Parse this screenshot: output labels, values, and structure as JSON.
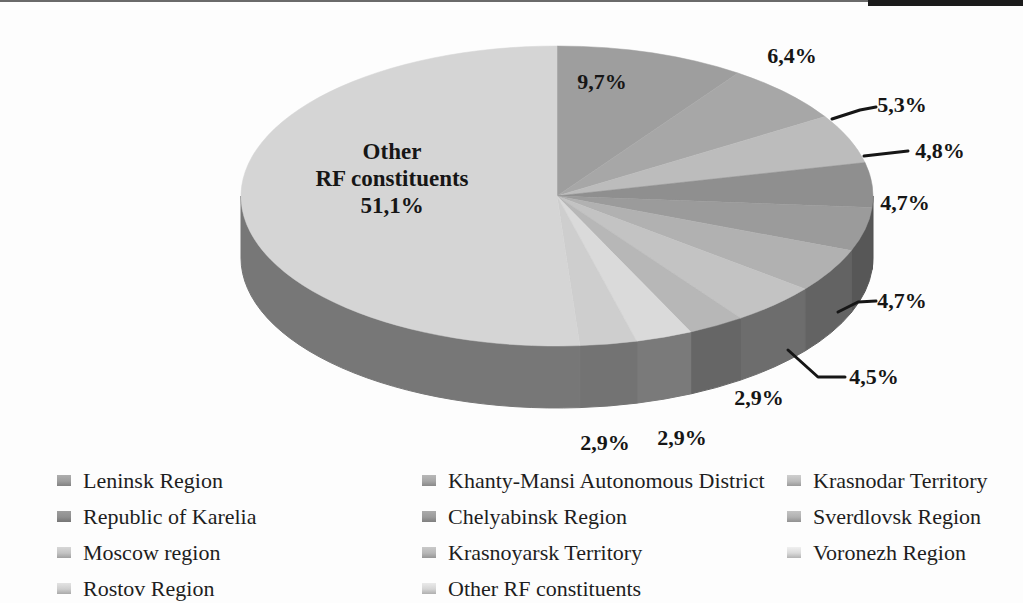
{
  "page": {
    "background": "#fdfdfd",
    "top_rule_color": "#1b1b1b"
  },
  "chart_data": {
    "type": "pie",
    "style": "3d",
    "title": "",
    "decimal_separator": ",",
    "start_angle_deg": 0,
    "direction": "clockwise",
    "legend_position": "bottom",
    "slices": [
      {
        "label": "Leninsk Region",
        "value": 9.7,
        "display": "9,7%",
        "color": "#9e9e9e"
      },
      {
        "label": "Khanty-Mansi Autonomous District",
        "value": 6.4,
        "display": "6,4%",
        "color": "#a7a7a7"
      },
      {
        "label": "Krasnodar Territory",
        "value": 5.3,
        "display": "5,3%",
        "color": "#bcbcbc"
      },
      {
        "label": "Republic of Karelia",
        "value": 4.8,
        "display": "4,8%",
        "color": "#8f8f8f"
      },
      {
        "label": "Chelyabinsk Region",
        "value": 4.7,
        "display": "4,7%",
        "color": "#9b9b9b"
      },
      {
        "label": "Sverdlovsk Region",
        "value": 4.7,
        "display": "4,7%",
        "color": "#b1b1b1"
      },
      {
        "label": "Moscow region",
        "value": 4.5,
        "display": "4,5%",
        "color": "#c3c3c3"
      },
      {
        "label": "Krasnoyarsk Territory",
        "value": 2.9,
        "display": "2,9%",
        "color": "#b7b7b7"
      },
      {
        "label": "Voronezh Region",
        "value": 2.9,
        "display": "2,9%",
        "color": "#dadada"
      },
      {
        "label": "Rostov Region",
        "value": 2.9,
        "display": "2,9%",
        "color": "#cecece"
      },
      {
        "label": "Other RF constituents",
        "value": 51.1,
        "display": "51,1%",
        "color": "#d5d5d5",
        "inner_label_lines": [
          "Other",
          "RF constituents",
          "51,1%"
        ]
      }
    ],
    "legend_columns": [
      [
        "Leninsk Region",
        "Republic of Karelia",
        "Moscow region",
        "Rostov Region"
      ],
      [
        "Khanty-Mansi Autonomous District",
        "Chelyabinsk Region",
        "Krasnoyarsk Territory",
        "Other RF constituents"
      ],
      [
        "Krasnodar Territory",
        "Sverdlovsk Region",
        "Voronezh Region"
      ]
    ]
  }
}
